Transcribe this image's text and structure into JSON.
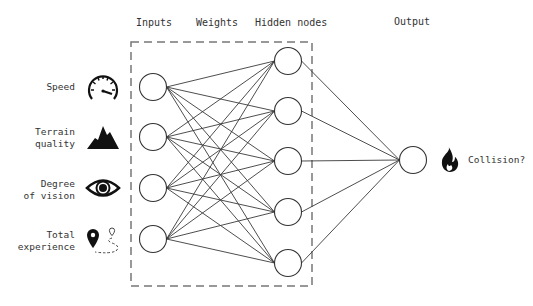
{
  "headers": {
    "inputs": "Inputs",
    "weights": "Weights",
    "hidden": "Hidden nodes",
    "output": "Output"
  },
  "inputs": [
    {
      "label_line1": "Speed",
      "label_line2": "",
      "icon": "speedometer-icon"
    },
    {
      "label_line1": "Terrain",
      "label_line2": "quality",
      "icon": "mountain-icon"
    },
    {
      "label_line1": "Degree",
      "label_line2": "of vision",
      "icon": "eye-icon"
    },
    {
      "label_line1": "Total",
      "label_line2": "experience",
      "icon": "map-route-icon"
    }
  ],
  "output": {
    "label": "Collision?",
    "icon": "fire-icon"
  },
  "network": {
    "input_nodes": 4,
    "hidden_nodes": 5,
    "output_nodes": 1,
    "layer_box_style": "dashed"
  },
  "colors": {
    "stroke": "#333333",
    "icon": "#111111",
    "box": "#777777"
  }
}
